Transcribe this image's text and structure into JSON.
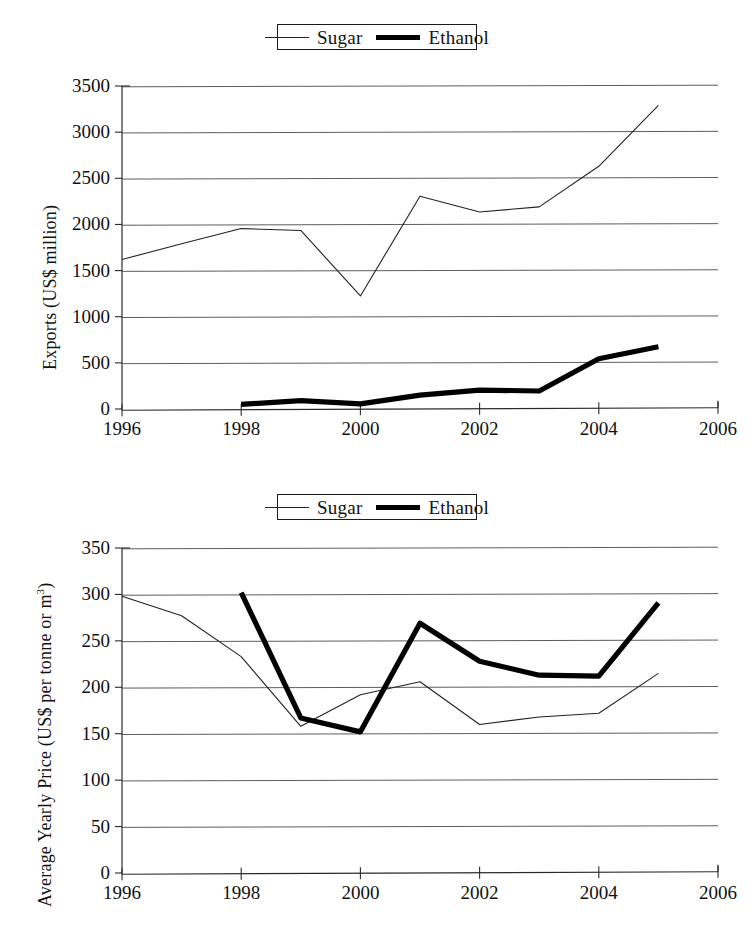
{
  "figure": {
    "series_names": [
      "Sugar",
      "Ethanol"
    ],
    "sugar_color": "#222222",
    "ethanol_color": "#000000"
  },
  "legend": {
    "entries": [
      {
        "label": "Sugar",
        "style": "thin",
        "icon": "thin-line-icon"
      },
      {
        "label": "Ethanol",
        "style": "thick",
        "icon": "thick-line-icon"
      }
    ]
  },
  "chart_data": [
    {
      "type": "line",
      "id": "exports",
      "title": "",
      "xlabel": "",
      "ylabel": "Exports (US$ million)",
      "xlim": [
        1996,
        2006
      ],
      "ylim": [
        0,
        3500
      ],
      "xticks": [
        1996,
        1998,
        2000,
        2002,
        2004,
        2006
      ],
      "xtick_labels": [
        "1996",
        "1998",
        "2000",
        "2002",
        "2004",
        "2006"
      ],
      "yticks": [
        0,
        500,
        1000,
        1500,
        2000,
        2500,
        3000,
        3500
      ],
      "ytick_labels": [
        "0",
        "500",
        "1000",
        "1500",
        "2000",
        "2500",
        "3000",
        "3500"
      ],
      "grid": true,
      "legend_position": "top-center",
      "series": [
        {
          "name": "Sugar",
          "style": "thin",
          "x": [
            1996,
            1997,
            1998,
            1999,
            2000,
            2001,
            2002,
            2003,
            2004,
            2005
          ],
          "values": [
            1620,
            1790,
            1955,
            1935,
            1225,
            2305,
            2135,
            2190,
            2630,
            3290
          ]
        },
        {
          "name": "Ethanol",
          "style": "thick",
          "x": [
            1998,
            1999,
            2000,
            2001,
            2002,
            2003,
            2004,
            2005
          ],
          "values": [
            50,
            90,
            55,
            150,
            205,
            195,
            545,
            675
          ]
        }
      ]
    },
    {
      "type": "line",
      "id": "price",
      "title": "",
      "xlabel": "",
      "ylabel": "Average Yearly Price (US$ per tonne or m",
      "ylabel_sup": "3",
      "ylabel_tail": ")",
      "xlim": [
        1996,
        2006
      ],
      "ylim": [
        0,
        350
      ],
      "xticks": [
        1996,
        1998,
        2000,
        2002,
        2004,
        2006
      ],
      "xtick_labels": [
        "1996",
        "1998",
        "2000",
        "2002",
        "2004",
        "2006"
      ],
      "yticks": [
        0,
        50,
        100,
        150,
        200,
        250,
        300,
        350
      ],
      "ytick_labels": [
        "0",
        "50",
        "100",
        "150",
        "200",
        "250",
        "300",
        "350"
      ],
      "grid": true,
      "legend_position": "top-center",
      "series": [
        {
          "name": "Sugar",
          "style": "thin",
          "x": [
            1996,
            1997,
            1998,
            1999,
            2000,
            2001,
            2002,
            2003,
            2004,
            2005
          ],
          "values": [
            298,
            277,
            233,
            158,
            192,
            206,
            160,
            168,
            172,
            215
          ]
        },
        {
          "name": "Ethanol",
          "style": "thick",
          "x": [
            1998,
            1999,
            2000,
            2001,
            2002,
            2003,
            2004,
            2005
          ],
          "values": [
            302,
            167,
            152,
            269,
            228,
            213,
            212,
            291
          ]
        }
      ]
    }
  ]
}
